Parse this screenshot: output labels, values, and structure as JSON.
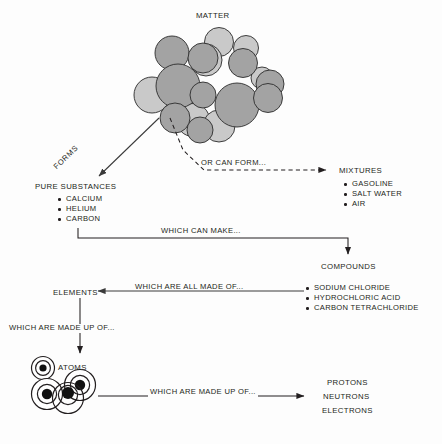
{
  "diagram": {
    "title": "MATTER",
    "nodes": {
      "matter": {
        "label": "MATTER"
      },
      "pure_substances": {
        "label": "PURE SUBSTANCES",
        "items": [
          "CALCIUM",
          "HELIUM",
          "CARBON"
        ]
      },
      "mixtures": {
        "label": "MIXTURES",
        "items": [
          "GASOLINE",
          "SALT WATER",
          "AIR"
        ]
      },
      "compounds": {
        "label": "COMPOUNDS",
        "items": [
          "SODIUM CHLORIDE",
          "HYDROCHLORIC ACID",
          "CARBON TETRACHLORIDE"
        ]
      },
      "elements": {
        "label": "ELEMENTS"
      },
      "atoms": {
        "label": "ATOMS"
      },
      "subatomic": {
        "items": [
          "PROTONS",
          "NEUTRONS",
          "ELECTRONS"
        ]
      }
    },
    "connectors": {
      "forms": "FORMS",
      "or_can_form": "OR CAN FORM...",
      "which_can_make": "WHICH CAN MAKE...",
      "which_are_all_made_of": "WHICH ARE ALL MADE OF...",
      "which_are_made_up_of_elements": "WHICH ARE MADE UP OF...",
      "which_are_made_up_of_atoms": "WHICH ARE MADE UP OF..."
    },
    "colors": {
      "background": "#fdfdfd",
      "ink": "#231f20",
      "sphere_dark": "#a3a3a3",
      "sphere_light": "#c9c9c9",
      "sphere_outline": "#2b2b2b",
      "atom_fill": "#111111"
    }
  }
}
